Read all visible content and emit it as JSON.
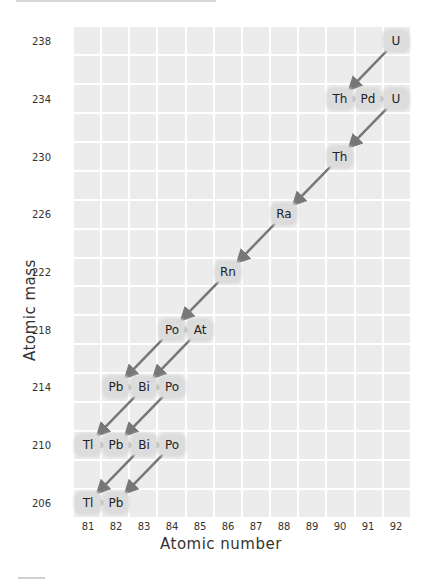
{
  "chart_data": {
    "type": "diagram",
    "xlabel": "Atomic number",
    "ylabel": "Atomic mass",
    "x_ticks": [
      81,
      82,
      83,
      84,
      85,
      86,
      87,
      88,
      89,
      90,
      91,
      92
    ],
    "y_ticks": [
      238,
      234,
      230,
      226,
      222,
      218,
      214,
      210,
      206
    ],
    "nodes": [
      {
        "label": "U",
        "z": 92,
        "a": 238
      },
      {
        "label": "Th",
        "z": 90,
        "a": 234
      },
      {
        "label": "Pd",
        "z": 91,
        "a": 234
      },
      {
        "label": "U",
        "z": 92,
        "a": 234
      },
      {
        "label": "Th",
        "z": 90,
        "a": 230
      },
      {
        "label": "Ra",
        "z": 88,
        "a": 226
      },
      {
        "label": "Rn",
        "z": 86,
        "a": 222
      },
      {
        "label": "Po",
        "z": 84,
        "a": 218
      },
      {
        "label": "At",
        "z": 85,
        "a": 218
      },
      {
        "label": "Pb",
        "z": 82,
        "a": 214
      },
      {
        "label": "Bi",
        "z": 83,
        "a": 214
      },
      {
        "label": "Po",
        "z": 84,
        "a": 214
      },
      {
        "label": "Tl",
        "z": 81,
        "a": 210
      },
      {
        "label": "Pb",
        "z": 82,
        "a": 210
      },
      {
        "label": "Bi",
        "z": 83,
        "a": 210
      },
      {
        "label": "Po",
        "z": 84,
        "a": 210
      },
      {
        "label": "Tl",
        "z": 81,
        "a": 206
      },
      {
        "label": "Pb",
        "z": 82,
        "a": 206
      }
    ],
    "alpha_decays": [
      [
        92,
        238,
        90,
        234
      ],
      [
        92,
        234,
        90,
        230
      ],
      [
        90,
        230,
        88,
        226
      ],
      [
        88,
        226,
        86,
        222
      ],
      [
        86,
        222,
        84,
        218
      ],
      [
        84,
        218,
        82,
        214
      ],
      [
        85,
        218,
        83,
        214
      ],
      [
        83,
        214,
        81,
        210
      ],
      [
        84,
        214,
        82,
        210
      ],
      [
        83,
        210,
        81,
        206
      ],
      [
        84,
        210,
        82,
        206
      ]
    ],
    "beta_decays": [
      [
        90,
        234,
        91,
        234
      ],
      [
        91,
        234,
        92,
        234
      ],
      [
        84,
        218,
        85,
        218
      ],
      [
        82,
        214,
        83,
        214
      ],
      [
        83,
        214,
        84,
        214
      ],
      [
        81,
        210,
        82,
        210
      ],
      [
        82,
        210,
        83,
        210
      ],
      [
        83,
        210,
        84,
        210
      ],
      [
        81,
        206,
        82,
        206
      ]
    ],
    "grid": true
  },
  "axes": {
    "xlabel": "Atomic number",
    "ylabel": "Atomic mass",
    "x_ticks": [
      "81",
      "82",
      "83",
      "84",
      "85",
      "86",
      "87",
      "88",
      "89",
      "90",
      "91",
      "92"
    ],
    "y_ticks": [
      "238",
      "234",
      "230",
      "226",
      "222",
      "218",
      "214",
      "210",
      "206"
    ]
  },
  "colors": {
    "grid_cell": "#ececec",
    "node_bg": "#dcdcdc",
    "arrow": "#777777"
  }
}
